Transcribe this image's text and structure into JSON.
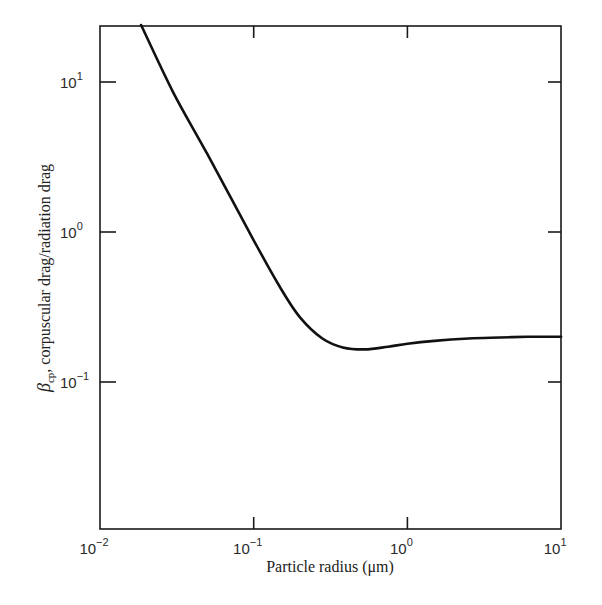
{
  "chart_data": {
    "type": "line",
    "title": "",
    "xlabel": "Particle radius (μm)",
    "ylabel": "βcp, corpuscular drag/radiation drag",
    "ylabel_parts": {
      "symbol": "β",
      "subscript": "cp",
      "rest": ", corpuscular drag/radiation drag"
    },
    "xscale": "log",
    "yscale": "log",
    "xlim": [
      0.01,
      10
    ],
    "ylim": [
      0.01,
      25
    ],
    "x_ticks": [
      {
        "value": 0.01,
        "base": "10",
        "exp": "−2"
      },
      {
        "value": 0.1,
        "base": "10",
        "exp": "−1"
      },
      {
        "value": 1,
        "base": "10",
        "exp": "0"
      },
      {
        "value": 10,
        "base": "10",
        "exp": "1"
      }
    ],
    "y_ticks": [
      {
        "value": 0.1,
        "base": "10",
        "exp": "−1"
      },
      {
        "value": 1,
        "base": "10",
        "exp": "0"
      },
      {
        "value": 10,
        "base": "10",
        "exp": "1"
      }
    ],
    "grid": false,
    "legend": null,
    "series": [
      {
        "name": "beta_cp",
        "color": "#111111",
        "x": [
          0.0185,
          0.03,
          0.05,
          0.1,
          0.15,
          0.2,
          0.28,
          0.38,
          0.53,
          0.75,
          1.0,
          1.5,
          2.5,
          4.0,
          6.0,
          10.0
        ],
        "y": [
          24,
          8.5,
          3.3,
          0.88,
          0.42,
          0.27,
          0.195,
          0.17,
          0.165,
          0.172,
          0.18,
          0.188,
          0.195,
          0.198,
          0.2,
          0.2
        ]
      }
    ]
  }
}
